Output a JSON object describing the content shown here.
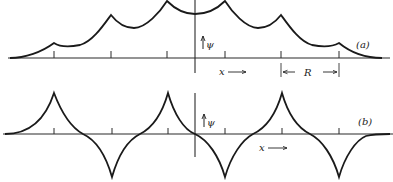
{
  "figure": {
    "panels": [
      {
        "id": "a",
        "label": "(a)",
        "description": "Symmetric (even) combination of atomic wavefunctions along a chain, psi positive everywhere with cusps at each atom",
        "y_axis_label": "ψ",
        "x_axis_label": "x",
        "spacing_label": "R"
      },
      {
        "id": "b",
        "label": "(b)",
        "description": "Alternating-sign combination of atomic wavefunctions along a chain, cusps alternating up and down at each atom",
        "y_axis_label": "ψ",
        "x_axis_label": "x"
      }
    ],
    "colors": {
      "line": "#1a1a1a",
      "background": "#ffffff"
    }
  }
}
